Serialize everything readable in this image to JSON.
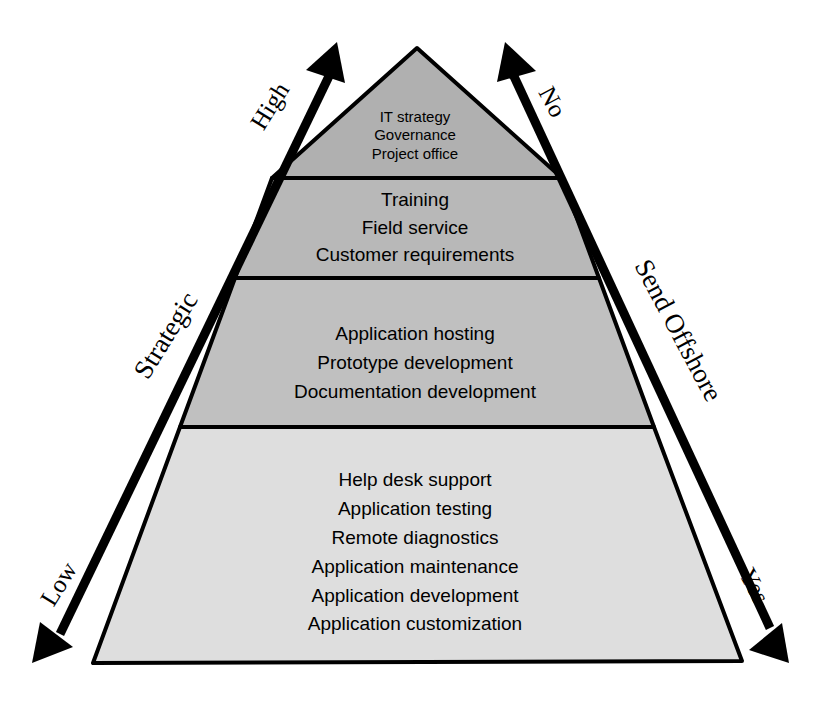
{
  "diagram": {
    "type": "pyramid",
    "colors": {
      "tier1_fill": "#b0b0b0",
      "tier2_fill": "#b8b8b8",
      "tier3_fill": "#c0c0c0",
      "tier4_fill": "#dedede",
      "outline": "#000000",
      "arrow": "#000000",
      "background": "#ffffff"
    },
    "tiers": [
      {
        "id": "tier-1",
        "position": "top",
        "items": [
          "IT strategy",
          "Governance",
          "Project office"
        ]
      },
      {
        "id": "tier-2",
        "position": "upper-middle",
        "items": [
          "Training",
          "Field service",
          "Customer requirements"
        ]
      },
      {
        "id": "tier-3",
        "position": "lower-middle",
        "items": [
          "Application hosting",
          "Prototype development",
          "Documentation development"
        ]
      },
      {
        "id": "tier-4",
        "position": "base",
        "items": [
          "Help desk support",
          "Application testing",
          "Remote diagnostics",
          "Application maintenance",
          "Application development",
          "Application customization"
        ]
      }
    ],
    "left_axis": {
      "name": "Strategic",
      "top_label": "High",
      "bottom_label": "Low"
    },
    "right_axis": {
      "name": "Send Offshore",
      "top_label": "No",
      "bottom_label": "Yes"
    }
  }
}
